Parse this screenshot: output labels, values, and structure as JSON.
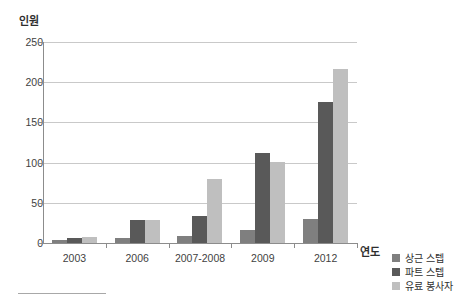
{
  "chart_data": {
    "type": "bar",
    "title": "",
    "xlabel": "연도",
    "ylabel": "인원",
    "categories": [
      "2003",
      "2006",
      "2007-2008",
      "2009",
      "2012"
    ],
    "series": [
      {
        "name": "상근 스텝",
        "color": "#7f7f7f",
        "values": [
          4,
          6,
          9,
          16,
          30
        ]
      },
      {
        "name": "파트 스텝",
        "color": "#595959",
        "values": [
          6,
          29,
          34,
          112,
          176
        ]
      },
      {
        "name": "유료 봉사자",
        "color": "#bfbfbf",
        "values": [
          8,
          29,
          79,
          101,
          216
        ]
      }
    ],
    "ylim": [
      0,
      250
    ],
    "yticks": [
      0,
      50,
      100,
      150,
      200,
      250
    ],
    "ytick_labels": [
      "0",
      "50",
      "100",
      "150",
      "200",
      "250"
    ],
    "grid": true,
    "legend_position": "right"
  }
}
